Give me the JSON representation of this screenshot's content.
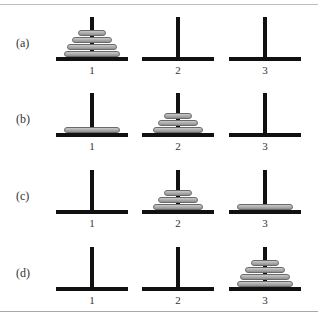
{
  "diagram": {
    "peg_labels": [
      "1",
      "2",
      "3"
    ],
    "disk_color": "#b0b0b0",
    "peg_color": "#111111",
    "rows": [
      {
        "label": "(a)",
        "pegs": [
          {
            "disks": [
              4,
              3,
              2,
              1
            ]
          },
          {
            "disks": []
          },
          {
            "disks": []
          }
        ]
      },
      {
        "label": "(b)",
        "pegs": [
          {
            "disks": [
              4
            ]
          },
          {
            "disks": [
              3,
              2,
              1
            ]
          },
          {
            "disks": []
          }
        ]
      },
      {
        "label": "(c)",
        "pegs": [
          {
            "disks": []
          },
          {
            "disks": [
              3,
              2,
              1
            ]
          },
          {
            "disks": [
              4
            ]
          }
        ]
      },
      {
        "label": "(d)",
        "pegs": [
          {
            "disks": []
          },
          {
            "disks": []
          },
          {
            "disks": [
              4,
              3,
              2,
              1
            ]
          }
        ]
      }
    ]
  }
}
